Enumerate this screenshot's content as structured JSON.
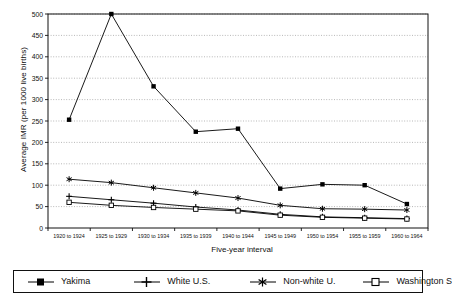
{
  "chart_data": {
    "type": "line",
    "title": "",
    "xlabel": "Five-year interval",
    "ylabel": "Average IMR (per 1000 live births)",
    "ylim": [
      0,
      500
    ],
    "ytick_step": 50,
    "yticks": [
      0,
      50,
      100,
      150,
      200,
      250,
      300,
      350,
      400,
      450,
      500
    ],
    "grid": true,
    "grid_axis": "y",
    "legend_position": "bottom",
    "categories": [
      "1920 to 1924",
      "1925 to 1929",
      "1930 to 1934",
      "1935 to 1939",
      "1940 to 1944",
      "1945 to 1949",
      "1950 to 1954",
      "1955 to 1959",
      "1960 to 1964"
    ],
    "series": [
      {
        "name": "Yakima",
        "marker": "filled-square",
        "color": "#000000",
        "values": [
          253,
          500,
          331,
          225,
          232,
          92,
          102,
          100,
          56
        ]
      },
      {
        "name": "White U.S.",
        "marker": "plus",
        "color": "#000000",
        "values": [
          74,
          66,
          58,
          49,
          42,
          32,
          26,
          24,
          22
        ]
      },
      {
        "name": "Non-white U.",
        "marker": "asterisk",
        "color": "#000000",
        "values": [
          114,
          106,
          94,
          82,
          70,
          53,
          45,
          44,
          42
        ]
      },
      {
        "name": "Washington S",
        "marker": "open-square",
        "color": "#000000",
        "values": [
          60,
          53,
          48,
          44,
          40,
          30,
          25,
          23,
          21
        ]
      }
    ]
  },
  "legend": {
    "items": [
      {
        "label": "Yakima"
      },
      {
        "label": "White U.S."
      },
      {
        "label": "Non-white U."
      },
      {
        "label": "Washington S"
      }
    ]
  },
  "axes": {
    "y_title": "Average IMR (per 1000 live births)",
    "x_title": "Five-year interval"
  }
}
